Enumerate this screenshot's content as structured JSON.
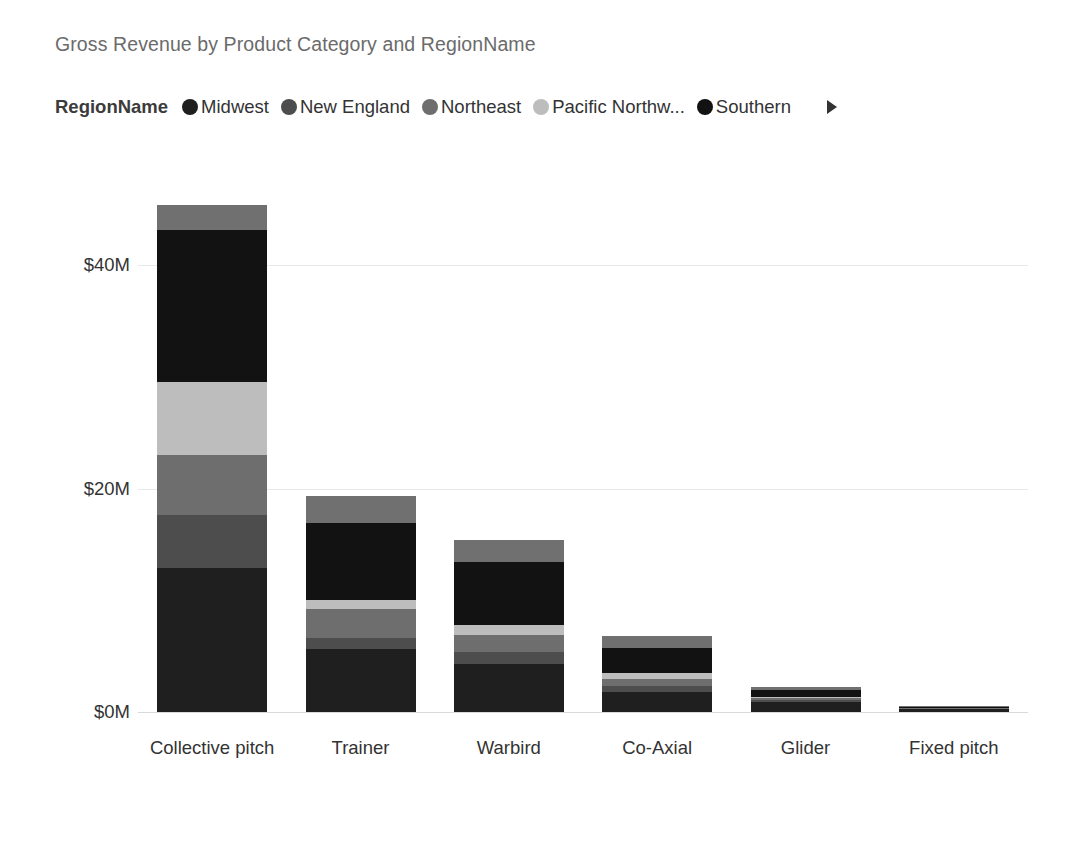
{
  "header": {
    "title": "Gross Revenue by Product Category and RegionName"
  },
  "legend": {
    "title": "RegionName",
    "next_icon": "chevron-right-icon",
    "items": [
      {
        "label": "Midwest",
        "color": "#1f1f1f"
      },
      {
        "label": "New England",
        "color": "#4d4d4d"
      },
      {
        "label": "Northeast",
        "color": "#6e6e6e"
      },
      {
        "label": "Pacific Northw...",
        "color": "#bdbdbd"
      },
      {
        "label": "Southern",
        "color": "#121212"
      }
    ]
  },
  "chart_data": {
    "type": "bar",
    "subtype": "stacked",
    "title": "Gross Revenue by Product Category and RegionName",
    "xlabel": "",
    "ylabel": "",
    "ylim": [
      0,
      49
    ],
    "yticks": [
      0,
      20,
      40
    ],
    "ytick_labels": [
      "$0M",
      "$20M",
      "$40M"
    ],
    "grid": true,
    "legend_position": "top",
    "units": "USD millions",
    "categories": [
      "Collective pitch",
      "Trainer",
      "Warbird",
      "Co-Axial",
      "Glider",
      "Fixed pitch"
    ],
    "series": [
      {
        "name": "Midwest",
        "color": "#1f1f1f",
        "values": [
          12.9,
          5.6,
          4.3,
          1.8,
          0.9,
          0.25
        ]
      },
      {
        "name": "New England",
        "color": "#4d4d4d",
        "values": [
          4.7,
          1.0,
          1.1,
          0.5,
          0.15,
          0.05
        ]
      },
      {
        "name": "Northeast",
        "color": "#6e6e6e",
        "values": [
          5.4,
          2.6,
          1.5,
          0.7,
          0.2,
          0.05
        ]
      },
      {
        "name": "Pacific Northw...",
        "color": "#bdbdbd",
        "values": [
          6.5,
          0.8,
          0.9,
          0.45,
          0.1,
          0.03
        ]
      },
      {
        "name": "Southern",
        "color": "#121212",
        "values": [
          13.6,
          6.9,
          5.6,
          2.3,
          0.6,
          0.1
        ]
      },
      {
        "name": "Other",
        "color": "#707070",
        "values": [
          2.3,
          2.4,
          2.0,
          1.1,
          0.3,
          0.05
        ]
      }
    ],
    "totals": [
      45.4,
      19.3,
      15.4,
      6.85,
      2.25,
      0.53
    ]
  },
  "axis": {
    "y_ticks": [
      {
        "label": "$0M",
        "value": 0
      },
      {
        "label": "$20M",
        "value": 20
      },
      {
        "label": "$40M",
        "value": 40
      }
    ],
    "x_ticks": [
      {
        "label": "Collective pitch"
      },
      {
        "label": "Trainer"
      },
      {
        "label": "Warbird"
      },
      {
        "label": "Co-Axial"
      },
      {
        "label": "Glider"
      },
      {
        "label": "Fixed pitch"
      }
    ]
  }
}
